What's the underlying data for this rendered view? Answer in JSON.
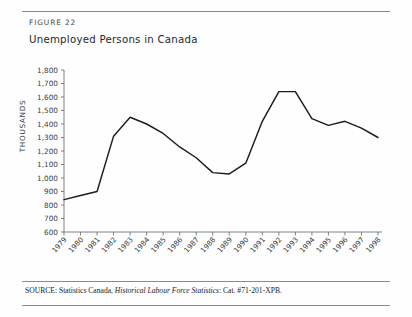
{
  "figure": {
    "label": "FIGURE 22",
    "title": "Unemployed Persons in Canada"
  },
  "source": {
    "prefix": "SOURCE: Statistics Canada, ",
    "italic_title": "Historical Labour Force Statistics",
    "suffix": ": Cat. #71-201-XPB."
  },
  "chart_data": {
    "type": "line",
    "title": "Unemployed Persons in Canada",
    "xlabel": "",
    "ylabel": "THOUSANDS",
    "ylim": [
      600,
      1800
    ],
    "ytick_step": 100,
    "grid": false,
    "legend": "none",
    "line_color": "#1c1c1c",
    "categories": [
      "1979",
      "1980",
      "1981",
      "1982",
      "1983",
      "1984",
      "1985",
      "1986",
      "1987",
      "1988",
      "1989",
      "1990",
      "1991",
      "1992",
      "1993",
      "1994",
      "1995",
      "1996",
      "1997",
      "1998"
    ],
    "yticks": [
      "600",
      "700",
      "800",
      "900",
      "1,000",
      "1,100",
      "1,200",
      "1,300",
      "1,400",
      "1,500",
      "1,600",
      "1,700",
      "1,800"
    ],
    "series": [
      {
        "name": "Unemployed Persons",
        "values": [
          840,
          870,
          900,
          1310,
          1450,
          1400,
          1330,
          1230,
          1150,
          1040,
          1030,
          1110,
          1420,
          1640,
          1640,
          1440,
          1390,
          1420,
          1370,
          1300
        ]
      }
    ]
  }
}
